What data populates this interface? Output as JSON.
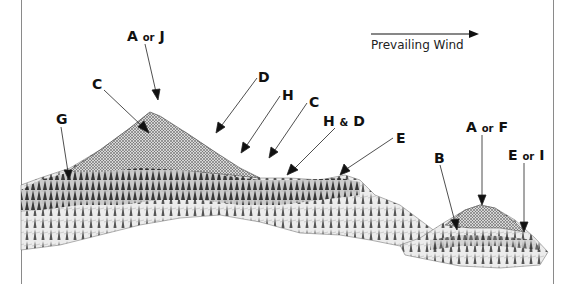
{
  "diagram": {
    "wind": {
      "label": "Prevailing Wind",
      "direction": "right"
    },
    "labels": [
      {
        "id": "a-or-j",
        "main": "A",
        "conj": "or",
        "second": "J",
        "x": 127,
        "y": 29
      },
      {
        "id": "c-left",
        "main": "C",
        "conj": "",
        "second": "",
        "x": 92,
        "y": 77
      },
      {
        "id": "d-upper",
        "main": "D",
        "conj": "",
        "second": "",
        "x": 258,
        "y": 70
      },
      {
        "id": "h-upper",
        "main": "H",
        "conj": "",
        "second": "",
        "x": 282,
        "y": 88
      },
      {
        "id": "c-right",
        "main": "C",
        "conj": "",
        "second": "",
        "x": 309,
        "y": 95
      },
      {
        "id": "h-and-d",
        "main": "H",
        "conj": "&",
        "second": "D",
        "x": 323,
        "y": 114
      },
      {
        "id": "e-mid",
        "main": "E",
        "conj": "",
        "second": "",
        "x": 396,
        "y": 131
      },
      {
        "id": "g-left",
        "main": "G",
        "conj": "",
        "second": "",
        "x": 56,
        "y": 112
      },
      {
        "id": "b",
        "main": "B",
        "conj": "",
        "second": "",
        "x": 434,
        "y": 151
      },
      {
        "id": "a-or-f",
        "main": "A",
        "conj": "or",
        "second": "F",
        "x": 466,
        "y": 120
      },
      {
        "id": "e-or-i",
        "main": "E",
        "conj": "or",
        "second": "I",
        "x": 508,
        "y": 148
      }
    ]
  }
}
